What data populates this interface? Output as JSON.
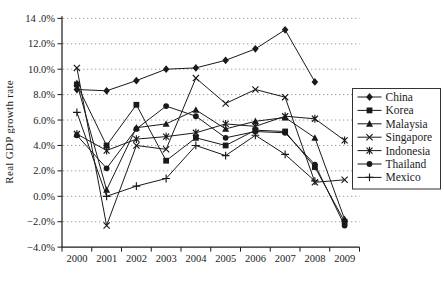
{
  "chart_data": {
    "type": "line",
    "title": "",
    "xlabel": "",
    "ylabel": "Real GDP growth rate",
    "ylim": [
      -4,
      14
    ],
    "y_tick_step": 2,
    "grid": "horizontal-dotted",
    "legend_position": "right-box",
    "line_color": "#1a1a1a",
    "grid_color": "#9a9a9a",
    "x": [
      2000,
      2001,
      2002,
      2003,
      2004,
      2005,
      2006,
      2007,
      2008,
      2009
    ],
    "x_tick_labels": [
      "2000",
      "2001",
      "2002",
      "2003",
      "2004",
      "2005",
      "2006",
      "2007",
      "2008",
      "2009"
    ],
    "y_ticks": [
      {
        "value": 14,
        "label": "14 .0%"
      },
      {
        "value": 12,
        "label": "12.0%"
      },
      {
        "value": 10,
        "label": "10.0%"
      },
      {
        "value": 8,
        "label": "8.0%"
      },
      {
        "value": 6,
        "label": "6.0%"
      },
      {
        "value": 4,
        "label": "4.0%"
      },
      {
        "value": 2,
        "label": "2.0%"
      },
      {
        "value": 0,
        "label": "0.0%"
      },
      {
        "value": -2,
        "label": "−2.0%"
      },
      {
        "value": -4,
        "label": "−4.0%"
      }
    ],
    "series": [
      {
        "name": "China",
        "marker": "diamond",
        "values": [
          8.4,
          8.3,
          9.1,
          10.0,
          10.1,
          10.7,
          11.6,
          13.1,
          9.0,
          null
        ]
      },
      {
        "name": "Korea",
        "marker": "square",
        "values": [
          8.8,
          4.0,
          7.2,
          2.8,
          4.6,
          4.0,
          5.2,
          5.1,
          2.3,
          -2.0
        ]
      },
      {
        "name": "Malaysia",
        "marker": "triangle",
        "values": [
          8.9,
          0.5,
          5.4,
          5.7,
          6.8,
          5.3,
          5.9,
          6.2,
          4.6,
          -1.8
        ]
      },
      {
        "name": "Singapore",
        "marker": "x",
        "values": [
          10.1,
          -2.3,
          4.0,
          3.7,
          9.3,
          7.3,
          8.4,
          7.8,
          1.1,
          1.3
        ]
      },
      {
        "name": "Indonesia",
        "marker": "asterisk",
        "values": [
          4.9,
          3.6,
          4.5,
          4.7,
          5.0,
          5.7,
          5.5,
          6.3,
          6.1,
          4.4
        ]
      },
      {
        "name": "Thailand",
        "marker": "circle",
        "values": [
          4.8,
          2.2,
          5.3,
          7.1,
          6.3,
          4.6,
          5.1,
          5.0,
          2.5,
          -2.3
        ]
      },
      {
        "name": "Mexico",
        "marker": "plus",
        "values": [
          6.6,
          0.0,
          0.8,
          1.4,
          4.0,
          3.2,
          4.8,
          3.3,
          1.2,
          null
        ]
      }
    ]
  }
}
